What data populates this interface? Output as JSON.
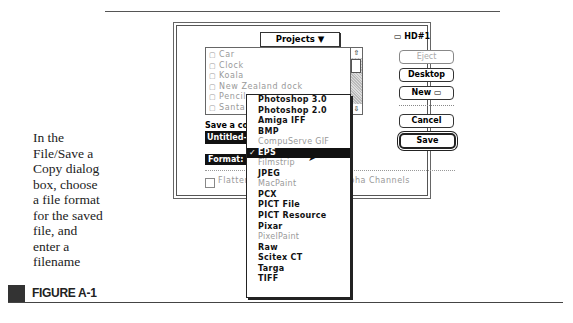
{
  "caption": {
    "text": "In the File/Save a Copy dialog box, choose a file format for the saved file, and enter a filename",
    "figure_label": "FIGURE A-1"
  },
  "dialog": {
    "folder_popup": "Projects ▼",
    "files": [
      "Car",
      "Clock",
      "Koala",
      "New Zealand dock",
      "Pencil",
      "Santa"
    ],
    "disk_label": "HD#1",
    "buttons": {
      "eject": "Eject",
      "desktop": "Desktop",
      "new": "New",
      "cancel": "Cancel",
      "save": "Save"
    },
    "save_label": "Save a copy in:",
    "filename_value": "Untitled-",
    "format_label": "Format:",
    "flatten_label": "Flatten Image",
    "alpha_label": "Include Alpha Channels"
  },
  "format_menu": {
    "items": [
      {
        "label": "Photoshop 3.0",
        "enabled": true
      },
      {
        "label": "Photoshop 2.0",
        "enabled": true
      },
      {
        "label": "Amiga IFF",
        "enabled": true
      },
      {
        "label": "BMP",
        "enabled": true
      },
      {
        "label": "CompuServe GIF",
        "enabled": false
      },
      {
        "label": "EPS",
        "enabled": true,
        "selected": true
      },
      {
        "label": "Filmstrip",
        "enabled": false
      },
      {
        "label": "JPEG",
        "enabled": true
      },
      {
        "label": "MacPaint",
        "enabled": false
      },
      {
        "label": "PCX",
        "enabled": true
      },
      {
        "label": "PICT File",
        "enabled": true
      },
      {
        "label": "PICT Resource",
        "enabled": true
      },
      {
        "label": "Pixar",
        "enabled": true
      },
      {
        "label": "PixelPaint",
        "enabled": false
      },
      {
        "label": "Raw",
        "enabled": true
      },
      {
        "label": "Scitex CT",
        "enabled": true
      },
      {
        "label": "Targa",
        "enabled": true
      },
      {
        "label": "TIFF",
        "enabled": true
      }
    ],
    "check_glyph": "✓"
  }
}
